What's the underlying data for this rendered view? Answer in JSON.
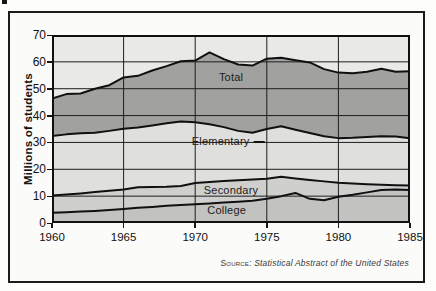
{
  "figure": {
    "source_prefix": "Source:",
    "source_text": "Statistical Abstract of the United States"
  },
  "chart_data": {
    "type": "area",
    "title": "",
    "xlabel": "",
    "ylabel": "Millions of students",
    "x": [
      1960,
      1961,
      1962,
      1963,
      1964,
      1965,
      1966,
      1967,
      1968,
      1969,
      1970,
      1971,
      1972,
      1973,
      1974,
      1975,
      1976,
      1977,
      1978,
      1979,
      1980,
      1981,
      1982,
      1983,
      1984,
      1985
    ],
    "xlim": [
      1960,
      1985
    ],
    "ylim": [
      0,
      70
    ],
    "yticks": [
      0,
      10,
      20,
      30,
      40,
      50,
      60,
      70
    ],
    "xticks": [
      1960,
      1965,
      1970,
      1975,
      1980,
      1985
    ],
    "x_gridlines": [
      1965,
      1970,
      1975,
      1980
    ],
    "y_gridlines": [
      10,
      20,
      30,
      40,
      50,
      60
    ],
    "grid": true,
    "legend_position": "inline-labels",
    "background_fill": "#e9e9e7",
    "grid_color": "#1d1d1d",
    "line_color": "#101010",
    "series": [
      {
        "name": "Total",
        "fill": "#a1a19f",
        "values": [
          46.3,
          48.0,
          48.2,
          50.0,
          51.3,
          54.2,
          54.8,
          56.8,
          58.4,
          60.2,
          60.5,
          63.5,
          61.0,
          59.0,
          58.6,
          61.2,
          61.5,
          60.6,
          59.8,
          57.3,
          56.0,
          55.8,
          56.3,
          57.4,
          56.3,
          56.5
        ]
      },
      {
        "name": "Elementary",
        "fill": "#dfdfdd",
        "values": [
          32.4,
          33.0,
          33.4,
          33.6,
          34.3,
          35.1,
          35.6,
          36.3,
          37.1,
          37.8,
          37.5,
          36.8,
          35.7,
          34.3,
          33.6,
          35.0,
          36.0,
          34.7,
          33.5,
          32.3,
          31.6,
          31.7,
          32.0,
          32.3,
          32.2,
          31.6
        ]
      },
      {
        "name": "Secondary",
        "fill": "#cfcfcd",
        "values": [
          10.2,
          10.6,
          11.0,
          11.5,
          12.0,
          12.5,
          13.3,
          13.4,
          13.5,
          13.8,
          14.9,
          15.3,
          15.6,
          15.9,
          16.2,
          16.5,
          17.2,
          16.6,
          16.0,
          15.5,
          15.0,
          14.7,
          14.4,
          14.2,
          14.1,
          14.0
        ]
      },
      {
        "name": "College",
        "fill": "#c2c2c0",
        "values": [
          3.8,
          4.0,
          4.3,
          4.5,
          4.8,
          5.2,
          5.7,
          6.0,
          6.4,
          6.7,
          7.0,
          7.3,
          7.6,
          7.9,
          8.3,
          9.0,
          10.0,
          11.2,
          9.0,
          8.5,
          9.8,
          10.5,
          11.4,
          12.3,
          12.5,
          12.3
        ]
      }
    ],
    "inline_labels": [
      {
        "text": "Total",
        "x": 1972.5,
        "y": 54.5,
        "dash": false
      },
      {
        "text": "Elementary",
        "x": 1972.3,
        "y": 30.5,
        "dash": true
      },
      {
        "text": "Secondary",
        "x": 1972.5,
        "y": 12.3,
        "dash": false
      },
      {
        "text": "College",
        "x": 1972.2,
        "y": 4.8,
        "dash": false
      }
    ]
  }
}
